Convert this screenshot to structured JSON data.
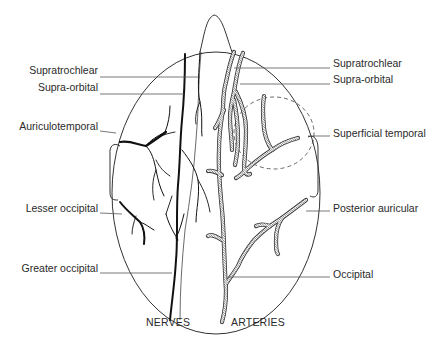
{
  "diagram": {
    "left_side_heading": "NERVES",
    "right_side_heading": "ARTERIES",
    "nerve_labels": [
      {
        "label": "Supratrochlear",
        "x": 98,
        "y": 70
      },
      {
        "label": "Supra-orbital",
        "x": 98,
        "y": 87
      },
      {
        "label": "Auriculotemporal",
        "x": 98,
        "y": 125
      },
      {
        "label": "Lesser occipital",
        "x": 98,
        "y": 207
      },
      {
        "label": "Greater occipital",
        "x": 98,
        "y": 267
      }
    ],
    "artery_labels": [
      {
        "label": "Supratrochlear",
        "x": 332,
        "y": 63
      },
      {
        "label": "Supra-orbital",
        "x": 332,
        "y": 79
      },
      {
        "label": "Superficial temporal",
        "x": 332,
        "y": 133
      },
      {
        "label": "Posterior auricular",
        "x": 332,
        "y": 208
      },
      {
        "label": "Occipital",
        "x": 332,
        "y": 274
      }
    ],
    "colors": {
      "line": "#333333",
      "nerve": "#111111",
      "artery_fill": "#ffffff",
      "background": "#ffffff",
      "text": "#2a2a2a"
    }
  }
}
